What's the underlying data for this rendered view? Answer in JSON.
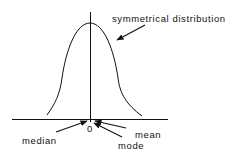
{
  "diagram": {
    "title": "symmetrical distribution",
    "labels": {
      "curve": "symmetrical distribution",
      "origin": "0",
      "median": "median",
      "mean": "mean",
      "mode": "mode"
    },
    "colors": {
      "ink": "#111111",
      "background": "#ffffff"
    }
  }
}
